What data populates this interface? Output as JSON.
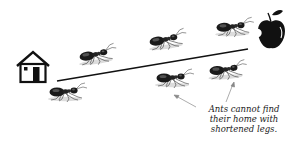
{
  "diagram": {
    "caption_lines": [
      "Ants cannot find",
      "their home with",
      "shortened legs."
    ],
    "icons": {
      "home": "house-icon",
      "food": "apple-icon",
      "ant": "ant-icon"
    },
    "path_line": {
      "from": [
        57,
        81
      ],
      "to": [
        248,
        49
      ],
      "color": "#111111"
    },
    "ants": [
      {
        "id": "ant-1",
        "x": 95,
        "y": 55
      },
      {
        "id": "ant-2",
        "x": 165,
        "y": 40
      },
      {
        "id": "ant-3",
        "x": 232,
        "y": 27
      },
      {
        "id": "ant-4",
        "x": 65,
        "y": 92
      },
      {
        "id": "ant-5",
        "x": 172,
        "y": 78
      },
      {
        "id": "ant-6",
        "x": 225,
        "y": 70
      }
    ],
    "colors": {
      "ink": "#111111",
      "background": "#ffffff",
      "shadow": "#d9d9d9"
    }
  }
}
